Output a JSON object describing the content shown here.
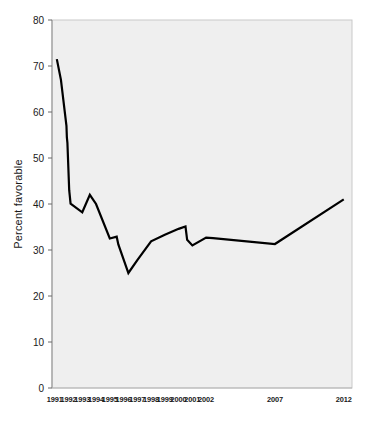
{
  "chart_data": {
    "type": "line",
    "title": "",
    "xlabel": "",
    "ylabel": "Percent favorable",
    "ylim": [
      0,
      80
    ],
    "ytick_labels": [
      "80",
      "70",
      "60",
      "50",
      "40",
      "30",
      "20",
      "10",
      "0"
    ],
    "ytick_values": [
      80,
      70,
      60,
      50,
      40,
      30,
      20,
      10,
      0
    ],
    "xtick_labels": [
      "1991",
      "1992",
      "1993",
      "1994",
      "1995",
      "1996",
      "1997",
      "1998",
      "1999",
      "2000",
      "2001",
      "2002",
      "2007",
      "2012"
    ],
    "xtick_values": [
      1991,
      1992,
      1993,
      1994,
      1995,
      1996,
      1997,
      1998,
      1999,
      2000,
      2001,
      2002,
      2007,
      2012
    ],
    "grid": false,
    "legend": null,
    "series": [
      {
        "name": "Percent favorable",
        "color": "#000000",
        "x": [
          1991.15,
          1991.45,
          1991.85,
          1991.88,
          1991.92,
          1992.05,
          1992.15,
          1993.0,
          1993.55,
          1994.0,
          1995.0,
          1995.5,
          1995.62,
          1996.35,
          1997.0,
          1998.0,
          1999.0,
          2000.0,
          2000.5,
          2000.62,
          2001.0,
          2002.0,
          2002.5,
          2007.0,
          2012.0
        ],
        "y": [
          71.5,
          67.0,
          57.0,
          54.5,
          53.3,
          43.0,
          40.1,
          38.2,
          42.0,
          40.0,
          32.5,
          32.9,
          31.2,
          25.0,
          27.8,
          31.9,
          33.3,
          34.6,
          35.1,
          32.2,
          31.0,
          32.7,
          32.6,
          31.3,
          41.0
        ]
      }
    ],
    "axis_ranges": {
      "x": [
        1990.8,
        2012.6
      ],
      "y": [
        0,
        80
      ]
    },
    "plot_background": "#efefef",
    "line_color": "#000000",
    "line_width": 2.2
  }
}
